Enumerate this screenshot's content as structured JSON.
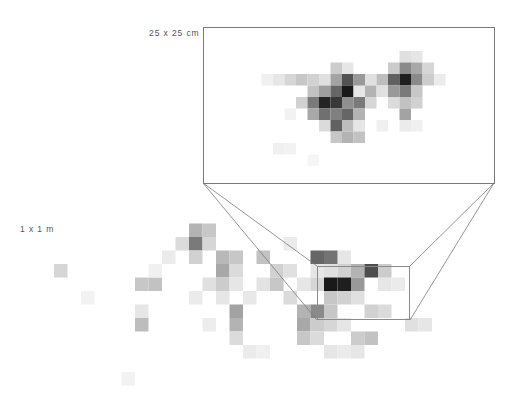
{
  "figure": {
    "width": 516,
    "height": 413,
    "background": "#ffffff",
    "line_color": "#7a7a7a",
    "text_color": "#555555"
  },
  "labels": {
    "inset_scale": "25 x 25 cm",
    "main_scale": "1 x 1 m"
  },
  "inset_panel": {
    "x": 203,
    "y": 27,
    "width": 292,
    "height": 157,
    "border_color": "#7a7a7a"
  },
  "source_rect": {
    "x": 317,
    "y": 266,
    "width": 93,
    "height": 54,
    "border_color": "#8a8a8a"
  },
  "connector_lines": [
    {
      "x1": 203,
      "y1": 183,
      "x2": 317,
      "y2": 266
    },
    {
      "x1": 203,
      "y1": 183,
      "x2": 317,
      "y2": 320
    },
    {
      "x1": 494,
      "y1": 183,
      "x2": 410,
      "y2": 266
    },
    {
      "x1": 494,
      "y1": 183,
      "x2": 410,
      "y2": 320
    }
  ],
  "chart_data": {
    "type": "heatmap",
    "title": "",
    "xlabel": "",
    "ylabel": "",
    "grid": false,
    "legend": "none",
    "colormap": "greys",
    "value_range": [
      0,
      1
    ],
    "note": "Two-panel spatial density heatmap: a 1 x 1 m field with a magnified 25 x 25 cm inset.",
    "panels": [
      {
        "name": "main-field",
        "scale_label": "1 x 1 m",
        "cell_size": 13.5,
        "origin": [
          0,
          210
        ],
        "cols": 38,
        "rows": 15,
        "cells": [
          {
            "c": 4,
            "r": 4,
            "v": 0.16
          },
          {
            "c": 10,
            "r": 5,
            "v": 0.22
          },
          {
            "c": 11,
            "r": 5,
            "v": 0.24
          },
          {
            "c": 10,
            "r": 7,
            "v": 0.1
          },
          {
            "c": 10,
            "r": 8,
            "v": 0.26
          },
          {
            "c": 14,
            "r": 1,
            "v": 0.3
          },
          {
            "c": 15,
            "r": 1,
            "v": 0.22
          },
          {
            "c": 14,
            "r": 2,
            "v": 0.52
          },
          {
            "c": 15,
            "r": 2,
            "v": 0.16
          },
          {
            "c": 13,
            "r": 2,
            "v": 0.14
          },
          {
            "c": 14,
            "r": 3,
            "v": 0.18
          },
          {
            "c": 16,
            "r": 3,
            "v": 0.28
          },
          {
            "c": 17,
            "r": 3,
            "v": 0.22
          },
          {
            "c": 16,
            "r": 4,
            "v": 0.34
          },
          {
            "c": 17,
            "r": 4,
            "v": 0.14
          },
          {
            "c": 15,
            "r": 5,
            "v": 0.12
          },
          {
            "c": 16,
            "r": 5,
            "v": 0.2
          },
          {
            "c": 17,
            "r": 5,
            "v": 0.1
          },
          {
            "c": 14,
            "r": 6,
            "v": 0.08
          },
          {
            "c": 16,
            "r": 6,
            "v": 0.1
          },
          {
            "c": 15,
            "r": 8,
            "v": 0.07
          },
          {
            "c": 17,
            "r": 7,
            "v": 0.36
          },
          {
            "c": 17,
            "r": 8,
            "v": 0.3
          },
          {
            "c": 17,
            "r": 9,
            "v": 0.14
          },
          {
            "c": 19,
            "r": 3,
            "v": 0.24
          },
          {
            "c": 20,
            "r": 4,
            "v": 0.18
          },
          {
            "c": 21,
            "r": 4,
            "v": 0.12
          },
          {
            "c": 19,
            "r": 5,
            "v": 0.11
          },
          {
            "c": 20,
            "r": 5,
            "v": 0.22
          },
          {
            "c": 21,
            "r": 6,
            "v": 0.14
          },
          {
            "c": 18,
            "r": 6,
            "v": 0.09
          },
          {
            "c": 22,
            "r": 5,
            "v": 0.1
          },
          {
            "c": 23,
            "r": 5,
            "v": 0.16
          },
          {
            "c": 24,
            "r": 4,
            "v": 0.12
          },
          {
            "c": 22,
            "r": 7,
            "v": 0.3
          },
          {
            "c": 23,
            "r": 7,
            "v": 0.46
          },
          {
            "c": 24,
            "r": 7,
            "v": 0.22
          },
          {
            "c": 22,
            "r": 8,
            "v": 0.34
          },
          {
            "c": 23,
            "r": 8,
            "v": 0.2
          },
          {
            "c": 24,
            "r": 8,
            "v": 0.16
          },
          {
            "c": 22,
            "r": 9,
            "v": 0.22
          },
          {
            "c": 23,
            "r": 9,
            "v": 0.14
          },
          {
            "c": 25,
            "r": 8,
            "v": 0.1
          },
          {
            "c": 26,
            "r": 6,
            "v": 0.12
          },
          {
            "c": 27,
            "r": 7,
            "v": 0.18
          },
          {
            "c": 28,
            "r": 7,
            "v": 0.14
          },
          {
            "c": 26,
            "r": 9,
            "v": 0.2
          },
          {
            "c": 27,
            "r": 9,
            "v": 0.24
          },
          {
            "c": 26,
            "r": 10,
            "v": 0.1
          },
          {
            "c": 28,
            "r": 5,
            "v": 0.1
          },
          {
            "c": 29,
            "r": 5,
            "v": 0.08
          },
          {
            "c": 25,
            "r": 3,
            "v": 0.1
          },
          {
            "c": 21,
            "r": 2,
            "v": 0.08
          },
          {
            "c": 9,
            "r": 12,
            "v": 0.05
          },
          {
            "c": 18,
            "r": 10,
            "v": 0.08
          },
          {
            "c": 19,
            "r": 10,
            "v": 0.06
          },
          {
            "c": 24,
            "r": 10,
            "v": 0.1
          },
          {
            "c": 25,
            "r": 10,
            "v": 0.08
          },
          {
            "c": 30,
            "r": 8,
            "v": 0.12
          },
          {
            "c": 31,
            "r": 8,
            "v": 0.1
          },
          {
            "c": 23,
            "r": 4,
            "v": 0.1
          },
          {
            "c": 12,
            "r": 3,
            "v": 0.08
          },
          {
            "c": 11,
            "r": 4,
            "v": 0.06
          },
          {
            "c": 6,
            "r": 6,
            "v": 0.05
          },
          {
            "c": 23,
            "r": 3,
            "v": 0.6
          },
          {
            "c": 24,
            "r": 3,
            "v": 0.55
          },
          {
            "c": 25,
            "r": 4,
            "v": 0.18
          },
          {
            "c": 24,
            "r": 5,
            "v": 0.9
          },
          {
            "c": 25,
            "r": 5,
            "v": 0.88
          },
          {
            "c": 26,
            "r": 4,
            "v": 0.3
          },
          {
            "c": 27,
            "r": 4,
            "v": 0.7
          },
          {
            "c": 28,
            "r": 4,
            "v": 0.2
          },
          {
            "c": 26,
            "r": 5,
            "v": 0.4
          },
          {
            "c": 24,
            "r": 6,
            "v": 0.22
          },
          {
            "c": 25,
            "r": 6,
            "v": 0.18
          }
        ]
      },
      {
        "name": "magnified-inset",
        "scale_label": "25 x 25 cm",
        "cell_size": 11.5,
        "origin": [
          204,
          28
        ],
        "cols": 25,
        "rows": 13,
        "cells": [
          {
            "c": 5,
            "r": 4,
            "v": 0.06
          },
          {
            "c": 6,
            "r": 4,
            "v": 0.1
          },
          {
            "c": 7,
            "r": 4,
            "v": 0.16
          },
          {
            "c": 8,
            "r": 4,
            "v": 0.22
          },
          {
            "c": 9,
            "r": 4,
            "v": 0.18
          },
          {
            "c": 10,
            "r": 4,
            "v": 0.12
          },
          {
            "c": 11,
            "r": 3,
            "v": 0.2
          },
          {
            "c": 12,
            "r": 3,
            "v": 0.1
          },
          {
            "c": 11,
            "r": 4,
            "v": 0.36
          },
          {
            "c": 12,
            "r": 4,
            "v": 0.68
          },
          {
            "c": 13,
            "r": 4,
            "v": 0.4
          },
          {
            "c": 14,
            "r": 4,
            "v": 0.12
          },
          {
            "c": 9,
            "r": 5,
            "v": 0.24
          },
          {
            "c": 10,
            "r": 5,
            "v": 0.38
          },
          {
            "c": 11,
            "r": 5,
            "v": 0.6
          },
          {
            "c": 12,
            "r": 5,
            "v": 0.9
          },
          {
            "c": 13,
            "r": 5,
            "v": 0.55
          },
          {
            "c": 14,
            "r": 5,
            "v": 0.3
          },
          {
            "c": 8,
            "r": 6,
            "v": 0.18
          },
          {
            "c": 9,
            "r": 6,
            "v": 0.52
          },
          {
            "c": 10,
            "r": 6,
            "v": 0.86
          },
          {
            "c": 11,
            "r": 6,
            "v": 0.78
          },
          {
            "c": 12,
            "r": 6,
            "v": 0.44
          },
          {
            "c": 13,
            "r": 6,
            "v": 0.52
          },
          {
            "c": 14,
            "r": 6,
            "v": 0.16
          },
          {
            "c": 9,
            "r": 7,
            "v": 0.34
          },
          {
            "c": 10,
            "r": 7,
            "v": 0.56
          },
          {
            "c": 11,
            "r": 7,
            "v": 0.5
          },
          {
            "c": 12,
            "r": 7,
            "v": 0.6
          },
          {
            "c": 13,
            "r": 7,
            "v": 0.3
          },
          {
            "c": 10,
            "r": 8,
            "v": 0.14
          },
          {
            "c": 11,
            "r": 8,
            "v": 0.62
          },
          {
            "c": 12,
            "r": 8,
            "v": 0.26
          },
          {
            "c": 13,
            "r": 8,
            "v": 0.1
          },
          {
            "c": 11,
            "r": 9,
            "v": 0.22
          },
          {
            "c": 12,
            "r": 9,
            "v": 0.3
          },
          {
            "c": 13,
            "r": 9,
            "v": 0.24
          },
          {
            "c": 7,
            "r": 7,
            "v": 0.05
          },
          {
            "c": 6,
            "r": 10,
            "v": 0.06
          },
          {
            "c": 7,
            "r": 10,
            "v": 0.05
          },
          {
            "c": 9,
            "r": 11,
            "v": 0.04
          },
          {
            "c": 17,
            "r": 2,
            "v": 0.12
          },
          {
            "c": 18,
            "r": 2,
            "v": 0.1
          },
          {
            "c": 16,
            "r": 3,
            "v": 0.2
          },
          {
            "c": 17,
            "r": 3,
            "v": 0.46
          },
          {
            "c": 18,
            "r": 3,
            "v": 0.34
          },
          {
            "c": 19,
            "r": 3,
            "v": 0.16
          },
          {
            "c": 15,
            "r": 4,
            "v": 0.26
          },
          {
            "c": 16,
            "r": 4,
            "v": 0.62
          },
          {
            "c": 17,
            "r": 4,
            "v": 0.88
          },
          {
            "c": 18,
            "r": 4,
            "v": 0.46
          },
          {
            "c": 19,
            "r": 4,
            "v": 0.2
          },
          {
            "c": 15,
            "r": 5,
            "v": 0.12
          },
          {
            "c": 16,
            "r": 5,
            "v": 0.4
          },
          {
            "c": 17,
            "r": 5,
            "v": 0.52
          },
          {
            "c": 18,
            "r": 5,
            "v": 0.22
          },
          {
            "c": 16,
            "r": 6,
            "v": 0.14
          },
          {
            "c": 17,
            "r": 6,
            "v": 0.24
          },
          {
            "c": 18,
            "r": 6,
            "v": 0.18
          },
          {
            "c": 17,
            "r": 7,
            "v": 0.36
          },
          {
            "c": 15,
            "r": 8,
            "v": 0.06
          },
          {
            "c": 17,
            "r": 8,
            "v": 0.08
          },
          {
            "c": 18,
            "r": 8,
            "v": 0.06
          },
          {
            "c": 13,
            "r": 5,
            "v": 0.1
          },
          {
            "c": 20,
            "r": 4,
            "v": 0.08
          }
        ]
      }
    ]
  }
}
